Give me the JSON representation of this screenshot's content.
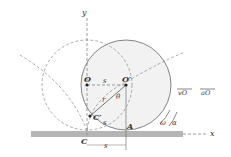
{
  "figure": {
    "type": "rolling-wheel-cycloid",
    "colors": {
      "ground": "#b5b5b5",
      "wheel_fill": "#f2f2f2",
      "line": "#666666",
      "text": "#333333"
    },
    "labels": {
      "y_axis": "y",
      "x_axis": "x",
      "center_initial": "O",
      "center_displaced": "O′",
      "displacement_top": "s",
      "displacement_bottom": "s",
      "arc_length": "s",
      "radius": "r",
      "angle": "θ",
      "point_on_rim": "C′",
      "initial_contact": "C",
      "contact_point": "A",
      "velocity": "vO",
      "acceleration": "aO",
      "angular_velocity": "ω",
      "angular_acceleration": "α"
    }
  }
}
